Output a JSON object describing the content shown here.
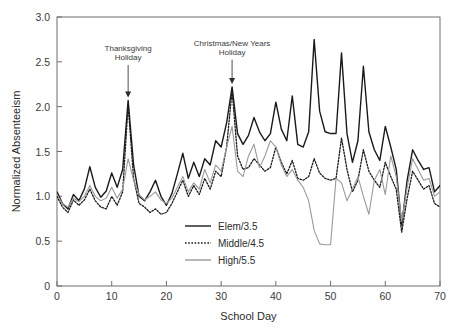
{
  "chart_data": {
    "type": "line",
    "title": "",
    "xlabel": "School Day",
    "ylabel": "Normalized Absenteeism",
    "xlim": [
      0,
      70
    ],
    "ylim": [
      0,
      3.0
    ],
    "xticks": [
      0,
      10,
      20,
      30,
      40,
      50,
      60,
      70
    ],
    "xtick_labels": [
      "0",
      "10",
      "20",
      "30",
      "40",
      "50",
      "60",
      "70"
    ],
    "yticks": [
      0,
      0.5,
      1.0,
      1.5,
      2.0,
      2.5,
      3.0
    ],
    "ytick_labels": [
      "0",
      "0.5",
      "1.0",
      "1.5",
      "2.0",
      "2.5",
      "3.0"
    ],
    "grid": false,
    "legend_position": "lower center",
    "colors": {
      "elem": "#1a1a1a",
      "middle": "#1a1a1a",
      "high": "#9a9a9a",
      "axis": "#6e6e6e",
      "text": "#2b2b2b"
    },
    "x": [
      0,
      1,
      2,
      3,
      4,
      5,
      6,
      7,
      8,
      9,
      10,
      11,
      12,
      13,
      14,
      15,
      16,
      17,
      18,
      19,
      20,
      21,
      22,
      23,
      24,
      25,
      26,
      27,
      28,
      29,
      30,
      31,
      32,
      33,
      34,
      35,
      36,
      37,
      38,
      39,
      40,
      41,
      42,
      43,
      44,
      45,
      46,
      47,
      48,
      49,
      50,
      51,
      52,
      53,
      54,
      55,
      56,
      57,
      58,
      59,
      60,
      61,
      62,
      63,
      64,
      65,
      66,
      67,
      68,
      69,
      70
    ],
    "series": [
      {
        "name": "Elem/3.5",
        "style": "solid",
        "color": "#1a1a1a",
        "values": [
          1.05,
          0.92,
          0.86,
          1.02,
          0.95,
          1.08,
          1.33,
          1.1,
          0.99,
          1.06,
          1.26,
          1.1,
          1.3,
          2.07,
          1.35,
          1.0,
          0.95,
          1.05,
          1.18,
          1.0,
          0.9,
          1.03,
          1.25,
          1.48,
          1.2,
          1.38,
          1.22,
          1.42,
          1.35,
          1.62,
          1.55,
          1.82,
          2.22,
          1.7,
          1.58,
          1.68,
          1.88,
          1.72,
          1.62,
          1.7,
          2.05,
          1.75,
          1.62,
          2.12,
          1.58,
          1.55,
          1.72,
          2.75,
          1.95,
          1.72,
          1.7,
          1.7,
          2.6,
          1.7,
          1.38,
          1.62,
          2.45,
          1.72,
          1.52,
          1.4,
          1.78,
          1.55,
          1.3,
          0.68,
          1.18,
          1.52,
          1.4,
          1.3,
          1.32,
          1.05,
          1.12
        ],
        "linewidth": 1.4
      },
      {
        "name": "Middle/4.5",
        "style": "dotted",
        "color": "#1a1a1a",
        "values": [
          1.0,
          0.88,
          0.82,
          0.96,
          0.9,
          0.96,
          1.08,
          0.95,
          0.88,
          0.86,
          1.0,
          0.9,
          1.05,
          2.02,
          1.2,
          0.92,
          0.88,
          0.82,
          0.86,
          0.8,
          0.82,
          0.92,
          1.05,
          1.18,
          1.0,
          1.12,
          1.02,
          1.2,
          1.08,
          1.28,
          1.22,
          1.55,
          2.18,
          1.45,
          1.3,
          1.32,
          1.42,
          1.35,
          1.28,
          1.32,
          1.55,
          1.38,
          1.25,
          1.4,
          1.2,
          1.18,
          1.22,
          1.42,
          1.26,
          1.2,
          1.18,
          1.2,
          1.65,
          1.3,
          1.05,
          1.18,
          1.52,
          1.28,
          1.18,
          1.1,
          1.38,
          1.22,
          1.08,
          0.6,
          0.98,
          1.28,
          1.18,
          1.08,
          1.12,
          0.92,
          0.88
        ],
        "linewidth": 1.3
      },
      {
        "name": "High/5.5",
        "style": "solid",
        "color": "#9a9a9a",
        "values": [
          1.02,
          0.92,
          0.88,
          0.98,
          0.94,
          1.0,
          1.12,
          1.0,
          0.95,
          0.98,
          1.1,
          0.98,
          1.08,
          1.42,
          1.18,
          1.02,
          0.96,
          1.0,
          1.05,
          0.96,
          0.92,
          0.98,
          1.1,
          1.22,
          1.05,
          1.15,
          1.08,
          1.3,
          1.15,
          1.35,
          1.28,
          1.55,
          1.78,
          1.28,
          1.22,
          1.45,
          1.58,
          1.32,
          1.45,
          1.62,
          1.55,
          1.35,
          1.22,
          1.3,
          1.18,
          1.1,
          0.95,
          0.62,
          0.47,
          0.46,
          0.46,
          1.2,
          1.15,
          0.95,
          1.08,
          1.22,
          1.0,
          0.8,
          1.18,
          1.3,
          1.02,
          1.45,
          1.22,
          0.72,
          1.1,
          1.42,
          1.3,
          1.18,
          1.2,
          1.0,
          1.05
        ],
        "linewidth": 1.1
      }
    ],
    "annotations": [
      {
        "text_line1": "Thanksgiving",
        "text_line2": "Holiday",
        "x": 13,
        "y": 2.07,
        "label_x": 13,
        "label_y": 2.62
      },
      {
        "text_line1": "Christmas/New Years",
        "text_line2": "Holiday",
        "x": 32,
        "y": 2.22,
        "label_x": 32,
        "label_y": 2.68
      }
    ],
    "legend": [
      {
        "label": "Elem/3.5",
        "style": "solid",
        "color": "#1a1a1a"
      },
      {
        "label": "Middle/4.5",
        "style": "dotted",
        "color": "#1a1a1a"
      },
      {
        "label": "High/5.5",
        "style": "solid",
        "color": "#9a9a9a"
      }
    ]
  }
}
